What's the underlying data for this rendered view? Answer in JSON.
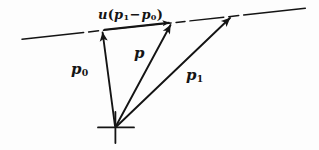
{
  "figure": {
    "background_color": "#fdfdfd",
    "ink_color": "#141414",
    "width": 319,
    "height": 150
  },
  "labels": {
    "u_expression": {
      "full_text": "u(p₁ − p₀)",
      "scalar": "u",
      "open_paren": "(",
      "term_1_base": "p",
      "term_1_sub": "1",
      "operator": "−",
      "term_2_base": "p",
      "term_2_sub": "0",
      "close_paren": ")"
    },
    "p0": {
      "full_text": "p₀",
      "base": "p",
      "sub": "0"
    },
    "p": {
      "full_text": "p",
      "base": "p",
      "sub": ""
    },
    "p1": {
      "full_text": "p₁",
      "base": "p",
      "sub": "1"
    }
  },
  "geometry": {
    "origin": {
      "x": 115,
      "y": 127,
      "marker": "cross"
    },
    "vectors": [
      {
        "name": "p0",
        "from": [
          115,
          127
        ],
        "to": [
          102,
          30
        ],
        "arrow": true
      },
      {
        "name": "p",
        "from": [
          115,
          127
        ],
        "to": [
          172,
          22
        ],
        "arrow": true
      },
      {
        "name": "p1",
        "from": [
          115,
          127
        ],
        "to": [
          232,
          15
        ],
        "arrow": true
      }
    ],
    "guide_line": {
      "name": "dash-dot-line",
      "from": [
        22,
        39
      ],
      "to": [
        308,
        8
      ],
      "style": "dash-dot"
    },
    "displacement_arrow": {
      "name": "u-displacement-arrow",
      "from": [
        103,
        29
      ],
      "to": [
        171,
        21
      ],
      "arrow": true
    }
  }
}
